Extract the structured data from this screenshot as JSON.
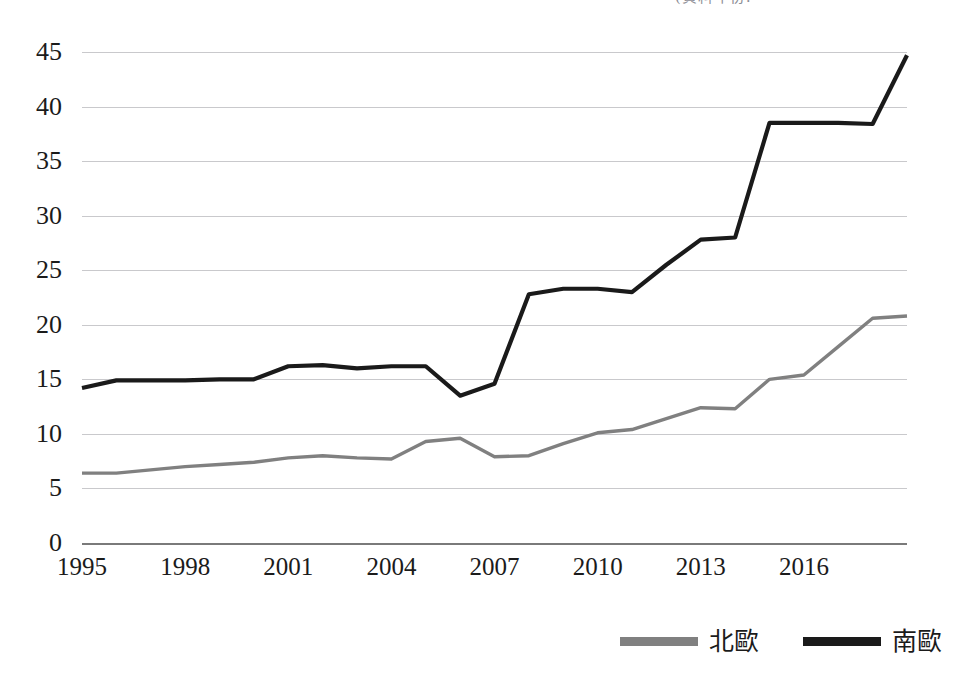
{
  "top_caption": "(資料年份:",
  "chart_data": {
    "type": "line",
    "title": "",
    "subtitle": "",
    "xlabel": "",
    "ylabel": "",
    "xlim": [
      1995,
      2019
    ],
    "ylim": [
      0,
      45
    ],
    "y_ticks": [
      0,
      5,
      10,
      15,
      20,
      25,
      30,
      35,
      40,
      45
    ],
    "x_tick_labels": [
      "1995",
      "1998",
      "2001",
      "2004",
      "2007",
      "2010",
      "2013",
      "2016"
    ],
    "x_tick_values": [
      1995,
      1998,
      2001,
      2004,
      2007,
      2010,
      2013,
      2016
    ],
    "grid": true,
    "legend_position": "bottom-right",
    "x": [
      1995,
      1996,
      1997,
      1998,
      1999,
      2000,
      2001,
      2002,
      2003,
      2004,
      2005,
      2006,
      2007,
      2008,
      2009,
      2010,
      2011,
      2012,
      2013,
      2014,
      2015,
      2016,
      2017,
      2018,
      2019
    ],
    "series": [
      {
        "name": "北歐",
        "color": "#808080",
        "values": [
          6.4,
          6.4,
          6.7,
          7.0,
          7.2,
          7.4,
          7.8,
          8.0,
          7.8,
          7.7,
          9.3,
          9.6,
          7.9,
          8.0,
          9.1,
          10.1,
          10.4,
          11.4,
          12.4,
          12.3,
          15.0,
          15.4,
          18.0,
          20.6,
          20.8
        ]
      },
      {
        "name": "南歐",
        "color": "#1a1a1a",
        "values": [
          14.2,
          14.9,
          14.9,
          14.9,
          15.0,
          15.0,
          16.2,
          16.3,
          16.0,
          16.2,
          16.2,
          13.5,
          14.6,
          22.8,
          23.3,
          23.3,
          23.0,
          25.5,
          27.8,
          28.0,
          38.5,
          38.5,
          38.5,
          38.4,
          44.7
        ]
      }
    ]
  },
  "legend": {
    "items": [
      {
        "label": "北歐",
        "color": "#808080"
      },
      {
        "label": "南歐",
        "color": "#1a1a1a"
      }
    ]
  }
}
